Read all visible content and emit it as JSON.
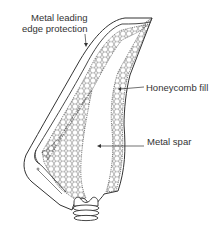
{
  "diagram": {
    "type": "labeled-illustration",
    "labels": {
      "leading_edge_line1": "Metal leading",
      "leading_edge_line2": "edge protection",
      "honeycomb": "Honeycomb fill",
      "spar": "Metal spar"
    },
    "colors": {
      "stroke": "#333333",
      "background": "#ffffff",
      "text": "#333333"
    }
  }
}
